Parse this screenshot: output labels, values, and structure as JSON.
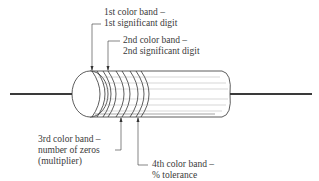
{
  "diagram": {
    "type": "resistor color code",
    "labels": {
      "band1": {
        "line1": "1st color band –",
        "line2": "1st significant digit"
      },
      "band2": {
        "line1": "2nd color band –",
        "line2": "2nd significant digit"
      },
      "band3": {
        "line1": "3rd color band –",
        "line2": "number of zeros",
        "line3": "(multiplier)"
      },
      "band4": {
        "line1": "4th color band –",
        "line2": "% tolerance"
      }
    },
    "colors": {
      "stroke": "#333333",
      "lead": "#3a3a3a",
      "background": "#ffffff"
    }
  }
}
